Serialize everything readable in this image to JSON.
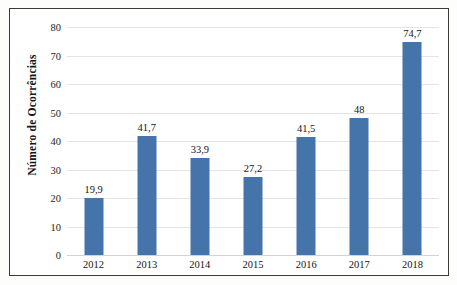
{
  "chart_data": {
    "type": "bar",
    "title": "",
    "xlabel": "",
    "ylabel": "Número de Ocorrências",
    "categories": [
      "2012",
      "2013",
      "2014",
      "2015",
      "2016",
      "2017",
      "2018"
    ],
    "values": [
      19.9,
      41.7,
      33.9,
      27.2,
      41.5,
      48,
      74.7
    ],
    "value_labels": [
      "19,9",
      "41,7",
      "33,9",
      "27,2",
      "41,5",
      "48",
      "74,7"
    ],
    "ylim": [
      0,
      80
    ],
    "yticks": [
      0,
      10,
      20,
      30,
      40,
      50,
      60,
      70,
      80
    ],
    "ytick_labels": [
      "0",
      "10",
      "20",
      "30",
      "40",
      "50",
      "60",
      "70",
      "80"
    ],
    "grid": "horizontal",
    "legend": "none",
    "series": [
      {
        "name": "Número de Ocorrências",
        "values": [
          19.9,
          41.7,
          33.9,
          27.2,
          41.5,
          48,
          74.7
        ]
      }
    ],
    "colors": {
      "bar": "#4574ab",
      "gridline": "#e3e4e6",
      "text": "#141414",
      "frame": "#3a3a3a"
    }
  }
}
